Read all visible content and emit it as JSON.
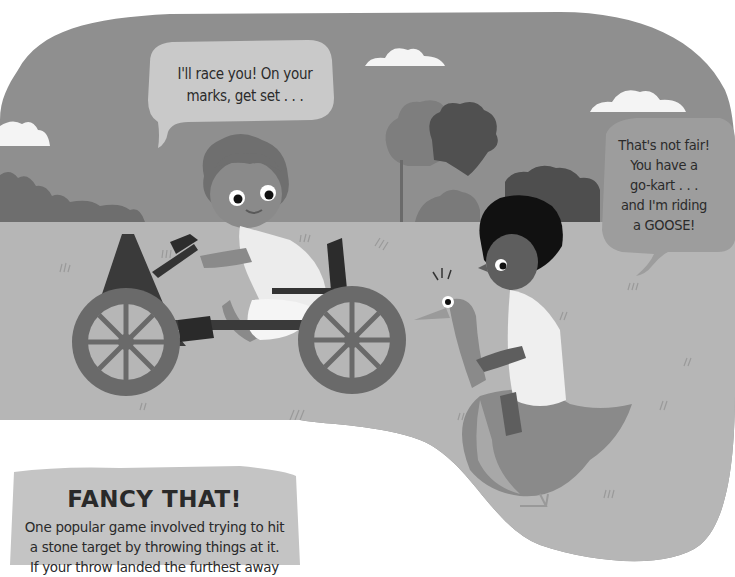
{
  "scene": {
    "description": "Illustration: a child in a wooden go-kart racing a child riding a goose",
    "colors": {
      "page_bg": "#ffffff",
      "sky": "#8f8f8f",
      "grass": "#b6b6b6",
      "cloud": "#f4f4f4",
      "bubble_light": "#c9c9c9",
      "bubble_dark": "#9d9d9d",
      "panel": "#c4c4c4"
    }
  },
  "speech_bubbles": [
    {
      "speaker": "go-kart child",
      "lines": [
        "I'll race you! On your",
        "marks, get set . . ."
      ]
    },
    {
      "speaker": "goose rider",
      "lines": [
        "That's not fair!",
        "You have a",
        "go-kart . . .",
        "and I'm riding",
        "a GOOSE!"
      ]
    }
  ],
  "fancy_that": {
    "title": "FANCY THAT!",
    "lines": [
      "One popular game involved trying to hit",
      "a stone target by throwing things at it.",
      "If your throw landed the furthest away"
    ]
  }
}
